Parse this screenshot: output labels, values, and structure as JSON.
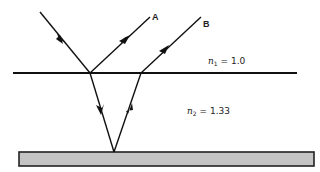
{
  "diagram": {
    "type": "thin-film reflection ray diagram",
    "ray_labels": {
      "a": "A",
      "b": "B"
    },
    "media": {
      "upper": {
        "symbol": "n",
        "subscript": "1",
        "equals": "= 1.0"
      },
      "film": {
        "symbol": "n",
        "subscript": "2",
        "equals": "= 1.33"
      }
    },
    "colors": {
      "line": "#111111",
      "substrate_fill": "#c4c4c4",
      "substrate_border": "#222222"
    }
  }
}
